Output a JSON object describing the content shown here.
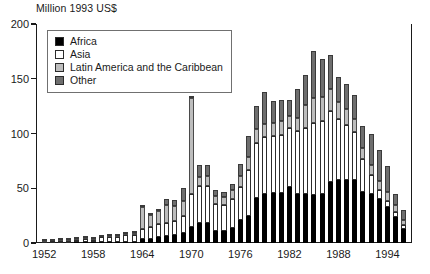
{
  "chart_data": {
    "type": "bar",
    "title": "Million 1993 US$",
    "subtitle": "",
    "xlabel": "",
    "ylabel": "Million 1993 US$",
    "stacked": true,
    "grid": false,
    "legend_position": "top-left",
    "ylim": [
      0,
      200
    ],
    "yticks": [
      0,
      50,
      100,
      150,
      200
    ],
    "ytick_labels": [
      "0",
      "50",
      "100",
      "150",
      "200"
    ],
    "xtick_labels": [
      "1952",
      "1958",
      "1964",
      "1970",
      "1976",
      "1982",
      "1988",
      "1994"
    ],
    "xtick_years": [
      1952,
      1958,
      1964,
      1970,
      1976,
      1982,
      1988,
      1994
    ],
    "xlim": [
      1951,
      1997
    ],
    "categories": [
      1952,
      1953,
      1954,
      1955,
      1956,
      1957,
      1958,
      1959,
      1960,
      1961,
      1962,
      1963,
      1964,
      1965,
      1966,
      1967,
      1968,
      1969,
      1970,
      1971,
      1972,
      1973,
      1974,
      1975,
      1976,
      1977,
      1978,
      1979,
      1980,
      1981,
      1982,
      1983,
      1984,
      1985,
      1986,
      1987,
      1988,
      1989,
      1990,
      1991,
      1992,
      1993,
      1994,
      1995,
      1996
    ],
    "series": [
      {
        "name": "Africa",
        "color": "#000000",
        "values": [
          0.3,
          0.3,
          0.4,
          0.4,
          0.5,
          0.5,
          0.6,
          0.6,
          0.8,
          0.8,
          1.0,
          1.2,
          3.5,
          4.0,
          5.5,
          6.5,
          7.0,
          9.5,
          14.5,
          18.5,
          18.5,
          11.0,
          11.0,
          14.0,
          21.0,
          25.0,
          41.0,
          45.0,
          46.0,
          46.0,
          51.0,
          45.0,
          45.0,
          44.0,
          45.0,
          56.0,
          58.0,
          58.0,
          58.0,
          47.0,
          45.0,
          40.0,
          33.0,
          24.0,
          13.0
        ]
      },
      {
        "name": "Asia",
        "color": "#ffffff",
        "values": [
          1.0,
          1.2,
          1.5,
          1.8,
          2.0,
          3.5,
          2.5,
          4.5,
          4.5,
          5.0,
          6.0,
          6.5,
          9.0,
          11.0,
          11.5,
          12.0,
          13.0,
          15.5,
          30.0,
          34.0,
          34.0,
          25.0,
          24.0,
          26.0,
          30.0,
          42.0,
          50.0,
          52.0,
          52.0,
          53.0,
          54.0,
          57.0,
          60.0,
          66.0,
          66.0,
          65.0,
          55.0,
          50.0,
          43.0,
          30.0,
          17.0,
          8.0,
          5.0,
          4.0,
          3.0
        ]
      },
      {
        "name": "Latin America and the Caribbean",
        "color": "#bdbdbd",
        "values": [
          0.8,
          0.7,
          0.8,
          0.8,
          0.8,
          0.8,
          0.8,
          0.8,
          0.8,
          0.9,
          0.9,
          1.0,
          20.0,
          11.0,
          12.0,
          16.0,
          14.0,
          13.0,
          88.0,
          8.0,
          9.0,
          7.0,
          7.0,
          8.0,
          10.0,
          12.0,
          13.0,
          12.0,
          12.0,
          12.0,
          11.0,
          12.0,
          21.0,
          22.0,
          22.0,
          20.0,
          16.0,
          14.0,
          12.0,
          10.0,
          9.0,
          9.0,
          9.0,
          7.0,
          5.0
        ]
      },
      {
        "name": "Other",
        "color": "#6e6e6e",
        "values": [
          0.4,
          0.4,
          0.4,
          0.4,
          0.4,
          0.4,
          0.4,
          0.4,
          0.4,
          0.4,
          0.4,
          0.4,
          1.5,
          1.5,
          2.0,
          5.5,
          5.0,
          12.0,
          2.0,
          11.0,
          10.0,
          5.0,
          5.0,
          6.0,
          11.0,
          19.0,
          21.0,
          29.0,
          20.0,
          20.0,
          15.0,
          27.0,
          27.0,
          43.0,
          35.0,
          31.0,
          23.0,
          23.0,
          22.0,
          20.0,
          29.0,
          28.0,
          23.0,
          10.0,
          9.0
        ]
      }
    ],
    "totals": [
      2.5,
      2.6,
      3.1,
      3.4,
      3.7,
      5.2,
      4.3,
      6.3,
      6.5,
      7.1,
      8.3,
      9.1,
      34.0,
      27.5,
      31.0,
      40.0,
      39.0,
      50.0,
      134.5,
      71.5,
      71.5,
      48.0,
      47.0,
      54.0,
      72.0,
      98.0,
      125.0,
      138.0,
      130.0,
      131.0,
      131.0,
      141.0,
      153.0,
      175.0,
      168.0,
      172.0,
      152.0,
      145.0,
      135.0,
      107.0,
      100.0,
      85.0,
      70.0,
      45.0,
      30.0
    ]
  },
  "legend": {
    "items": [
      {
        "label": "Africa",
        "swatch": "#000000"
      },
      {
        "label": "Asia",
        "swatch": "#ffffff"
      },
      {
        "label": "Latin America and the Caribbean",
        "swatch": "#bdbdbd"
      },
      {
        "label": "Other",
        "swatch": "#6e6e6e"
      }
    ]
  }
}
